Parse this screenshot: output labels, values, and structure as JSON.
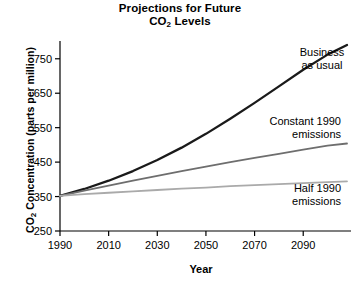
{
  "chart_data": {
    "type": "line",
    "title": "Projections for Future CO2 Levels",
    "title_lines": [
      "Projections for Future",
      "CO",
      " Levels"
    ],
    "title_sub": "2",
    "xlabel": "Year",
    "ylabel_pre": "CO",
    "ylabel_sub": "2",
    "ylabel_post": " Concentration (parts per million)",
    "ylabel": "CO2 Concentration (parts per million)",
    "xlim": [
      1990,
      2108
    ],
    "ylim": [
      250,
      790
    ],
    "xticks": [
      1990,
      2010,
      2030,
      2050,
      2070,
      2090
    ],
    "yticks": [
      250,
      350,
      450,
      550,
      650,
      750
    ],
    "grid": false,
    "legend": "inline-annotations",
    "x": [
      1990,
      2000,
      2010,
      2020,
      2030,
      2040,
      2050,
      2060,
      2070,
      2080,
      2090,
      2100,
      2108
    ],
    "series": [
      {
        "name": "Business as usual",
        "color": "#1a1a1a",
        "width": 2.3,
        "values": [
          352,
          372,
          396,
          424,
          456,
          492,
          532,
          576,
          622,
          670,
          718,
          762,
          790
        ],
        "label_lines": [
          "Business",
          "as usual"
        ],
        "label_align": "center"
      },
      {
        "name": "Constant 1990 emissions",
        "color": "#6e6e6e",
        "width": 1.8,
        "values": [
          352,
          367,
          382,
          396,
          410,
          424,
          437,
          450,
          462,
          474,
          486,
          498,
          504
        ],
        "label_lines": [
          "Constant 1990",
          "emissions"
        ],
        "label_align": "right"
      },
      {
        "name": "Half 1990 emissions",
        "color": "#aaaaaa",
        "width": 1.8,
        "values": [
          352,
          357,
          361,
          365,
          369,
          373,
          376,
          380,
          383,
          386,
          389,
          392,
          394
        ],
        "label_lines": [
          "Half 1990",
          "emissions"
        ],
        "label_align": "right"
      }
    ]
  }
}
